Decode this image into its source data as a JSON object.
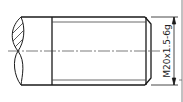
{
  "drawing": {
    "title": "External thread drawing (shaft end, broken section)",
    "thread_callout": "M20x1.5-6g",
    "colors": {
      "line": "#1a1a1a",
      "thin_line": "#444444",
      "background": "#ffffff"
    }
  }
}
